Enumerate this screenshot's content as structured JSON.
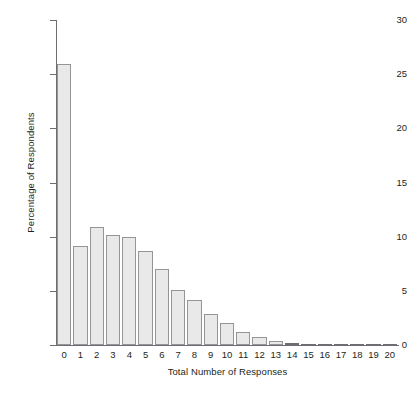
{
  "chart_data": {
    "type": "bar",
    "title": "",
    "xlabel": "Total Number of Responses",
    "ylabel": "Percentage of Respondents",
    "categories": [
      "0",
      "1",
      "2",
      "3",
      "4",
      "5",
      "6",
      "7",
      "8",
      "9",
      "10",
      "11",
      "12",
      "13",
      "14",
      "15",
      "16",
      "17",
      "18",
      "19",
      "20"
    ],
    "values": [
      25.9,
      9.1,
      10.9,
      10.2,
      10.0,
      8.7,
      7.0,
      5.1,
      4.2,
      2.9,
      2.0,
      1.2,
      0.75,
      0.4,
      0.2,
      0.12,
      0.08,
      0.06,
      0.05,
      0.04,
      0.04
    ],
    "ylim": [
      0,
      30
    ],
    "yticks": [
      0,
      5,
      10,
      15,
      20,
      25,
      30
    ],
    "ytick_labels": [
      "0",
      "5",
      "10",
      "15",
      "20",
      "25",
      "30"
    ],
    "grid": false,
    "legend": null,
    "bar_fill_color": "#e9e9e9",
    "bar_border_color": "#939598",
    "axis_color": "#6d6e71",
    "text_color": "#231f20",
    "background_color": "#ffffff"
  }
}
